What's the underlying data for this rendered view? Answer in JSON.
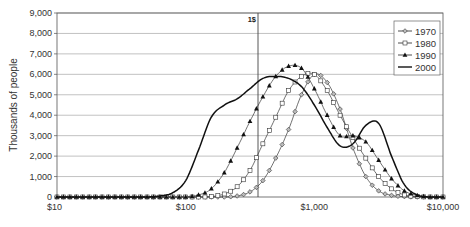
{
  "chart_data": {
    "type": "line",
    "title": "",
    "xlabel": "",
    "ylabel": "Thousands of people",
    "x_scale": "log",
    "xlim": [
      10,
      10000
    ],
    "ylim": [
      0,
      9000
    ],
    "grid": true,
    "legend_position": "top-right",
    "x_tick_labels": [
      "$10",
      "$100",
      "$1,000",
      "$10,000"
    ],
    "x_ticks": [
      10,
      100,
      1000,
      10000
    ],
    "y_tick_labels": [
      "0",
      "1,000",
      "2,000",
      "3,000",
      "4,000",
      "5,000",
      "6,000",
      "7,000",
      "8,000",
      "9,000"
    ],
    "y_ticks": [
      0,
      1000,
      2000,
      3000,
      4000,
      5000,
      6000,
      7000,
      8000,
      9000
    ],
    "annotations": [
      {
        "type": "vline",
        "x": 365,
        "label": "1$"
      }
    ],
    "x": [
      10,
      13,
      16,
      20,
      25,
      32,
      40,
      50,
      63,
      79,
      100,
      126,
      158,
      200,
      251,
      316,
      398,
      501,
      631,
      794,
      1000,
      1259,
      1585,
      1995,
      2512,
      3162,
      3981,
      5012,
      6310,
      7943,
      10000
    ],
    "series": [
      {
        "name": "1970",
        "marker": "diamond",
        "values": [
          0,
          0,
          0,
          0,
          0,
          0,
          0,
          0,
          0,
          0,
          0,
          0,
          0,
          0,
          50,
          250,
          800,
          1900,
          3300,
          5000,
          6000,
          5600,
          4300,
          2400,
          1000,
          300,
          80,
          20,
          0,
          0,
          0
        ]
      },
      {
        "name": "1980",
        "marker": "square",
        "values": [
          0,
          0,
          0,
          0,
          0,
          0,
          0,
          0,
          0,
          0,
          0,
          0,
          20,
          150,
          500,
          1300,
          2600,
          3900,
          5200,
          5900,
          6000,
          5200,
          4000,
          2900,
          1900,
          1000,
          400,
          100,
          20,
          0,
          0
        ]
      },
      {
        "name": "1990",
        "marker": "triangle",
        "values": [
          0,
          0,
          0,
          0,
          0,
          0,
          0,
          0,
          0,
          0,
          0,
          100,
          400,
          1200,
          2400,
          3700,
          4900,
          5900,
          6400,
          6300,
          5300,
          4000,
          3000,
          3000,
          2700,
          1800,
          900,
          300,
          80,
          0,
          0
        ]
      },
      {
        "name": "2000",
        "marker": "none",
        "values": [
          0,
          0,
          0,
          0,
          0,
          0,
          0,
          0,
          50,
          200,
          800,
          2300,
          3900,
          4500,
          4800,
          5300,
          5800,
          5900,
          5800,
          5400,
          4500,
          3400,
          2500,
          2600,
          3500,
          3600,
          2000,
          600,
          100,
          0,
          0
        ]
      }
    ]
  },
  "legend": {
    "items": [
      {
        "label": "1970"
      },
      {
        "label": "1980"
      },
      {
        "label": "1990"
      },
      {
        "label": "2000"
      }
    ]
  },
  "axes": {
    "ylabel": "Thousands of people",
    "vline_label": "1$"
  }
}
